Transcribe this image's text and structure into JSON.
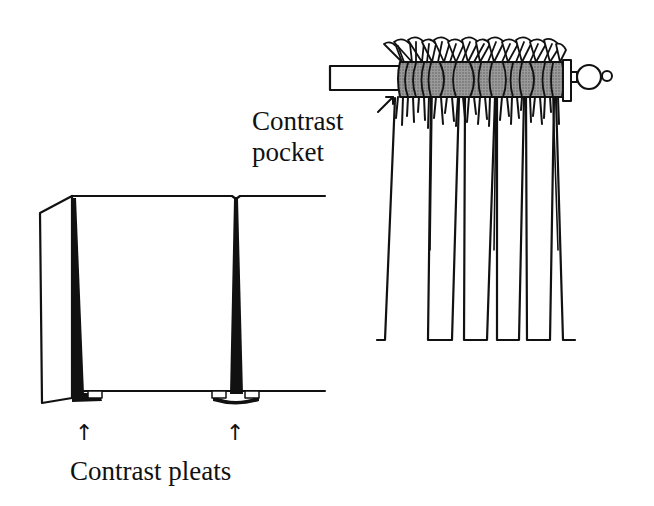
{
  "diagram": {
    "type": "illustration",
    "colors": {
      "line": "#111111",
      "pocket_fill": "#8a8a8a",
      "background": "#ffffff"
    },
    "figures": [
      {
        "id": "rod-pocket-curtain",
        "position": "top-right",
        "label": "Contrast pocket",
        "label_lines": [
          "Contrast",
          "pocket"
        ],
        "parts": [
          "curtain-rod",
          "finial",
          "gathered-header-ruffle",
          "contrast-pocket",
          "curtain-panels"
        ]
      },
      {
        "id": "box-pleated-valance",
        "position": "bottom-left",
        "label": "Contrast pleats",
        "arrow_count": 2,
        "parts": [
          "valance-return",
          "valance-front",
          "inverted-pleat-1",
          "inverted-pleat-2"
        ]
      }
    ]
  },
  "labels": {
    "pocket_line1": "Contrast",
    "pocket_line2": "pocket",
    "pleats": "Contrast pleats"
  },
  "icons": {
    "arrow_up": "↑"
  }
}
